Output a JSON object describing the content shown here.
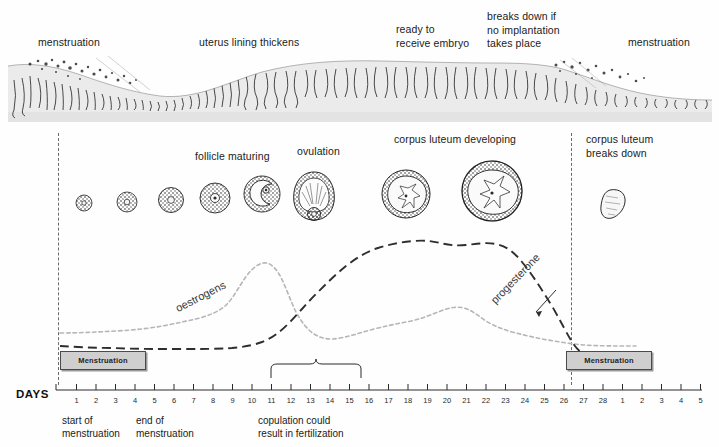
{
  "endometrium": {
    "labels": [
      {
        "text": "menstruation",
        "x": 38,
        "y": 36
      },
      {
        "text": "uterus lining thickens",
        "x": 199,
        "y": 36
      },
      {
        "text": "ready to\nreceive embryo",
        "x": 396,
        "y": 23
      },
      {
        "text": "breaks down if\nno implantation\ntakes place",
        "x": 487,
        "y": 10
      },
      {
        "text": "menstruation",
        "x": 628,
        "y": 36
      }
    ]
  },
  "follicles": {
    "labels": [
      {
        "text": "follicle maturing",
        "x": 195,
        "y": 150
      },
      {
        "text": "ovulation",
        "x": 297,
        "y": 145
      },
      {
        "text": "corpus luteum developing",
        "x": 394,
        "y": 133
      },
      {
        "text": "corpus luteum\nbreaks down",
        "x": 586,
        "y": 133
      }
    ],
    "stages": [
      {
        "name": "primordial-follicle",
        "cx": 84,
        "cy": 203,
        "r": 8,
        "kind": "solid"
      },
      {
        "name": "primary-follicle",
        "cx": 127,
        "cy": 202,
        "r": 10,
        "kind": "solid"
      },
      {
        "name": "secondary-follicle",
        "cx": 171,
        "cy": 200,
        "r": 12.5,
        "kind": "solid"
      },
      {
        "name": "tertiary-follicle",
        "cx": 215,
        "cy": 198,
        "r": 15,
        "kind": "ring"
      },
      {
        "name": "graafian-follicle",
        "cx": 262,
        "cy": 194,
        "r": 18,
        "kind": "antrum"
      },
      {
        "name": "ovulating-follicle",
        "cx": 314,
        "cy": 192,
        "r": 21,
        "kind": "ovulation"
      },
      {
        "name": "corpus-luteum-early",
        "cx": 406,
        "cy": 192,
        "r": 24,
        "kind": "luteum"
      },
      {
        "name": "corpus-luteum-mature",
        "cx": 492,
        "cy": 189,
        "r": 30,
        "kind": "luteum"
      },
      {
        "name": "corpus-albicans",
        "cx": 613,
        "cy": 193,
        "r": 15,
        "kind": "albicans"
      }
    ]
  },
  "graph": {
    "curve_labels": [
      {
        "name": "oestrogens",
        "text": "oestrogens",
        "x": 179,
        "y": 302,
        "rotate": -27
      },
      {
        "name": "progesterone",
        "text": "progesterone",
        "x": 497,
        "y": 294,
        "rotate": -46
      }
    ],
    "menstruation_boxes": [
      {
        "label": "Menstruation",
        "x": 60,
        "y": 351,
        "width": 84
      },
      {
        "label": "Menstruation",
        "x": 566,
        "y": 351,
        "width": 84
      }
    ],
    "fertile_brace": {
      "from_day": 11,
      "to_day": 15,
      "label": "copulation could\nresult in fertilization"
    }
  },
  "axis": {
    "caption": "DAYS",
    "day_labels": [
      "1",
      "2",
      "3",
      "4",
      "5",
      "6",
      "7",
      "8",
      "9",
      "10",
      "11",
      "12",
      "13",
      "14",
      "15",
      "16",
      "17",
      "18",
      "19",
      "20",
      "21",
      "22",
      "23",
      "24",
      "25",
      "26",
      "27",
      "28",
      "1",
      "2",
      "3",
      "4",
      "5"
    ],
    "x_start": 57,
    "x_step": 19.5
  },
  "footnotes": [
    {
      "text": "start of\nmenstruation",
      "x": 62,
      "y": 414
    },
    {
      "text": "end of\nmenstruation",
      "x": 136,
      "y": 414
    },
    {
      "text": "copulation could\nresult in fertilization",
      "x": 258,
      "y": 414
    }
  ],
  "chart_data": {
    "type": "line",
    "xlabel": "DAYS",
    "ylabel": "",
    "x": [
      1,
      2,
      3,
      4,
      5,
      6,
      7,
      8,
      9,
      10,
      11,
      12,
      13,
      14,
      15,
      16,
      17,
      18,
      19,
      20,
      21,
      22,
      23,
      24,
      25,
      26,
      27,
      28,
      29,
      30,
      31,
      32,
      33
    ],
    "xlim": [
      1,
      33
    ],
    "ylim": [
      0,
      100
    ],
    "grid": false,
    "legend": "inline-curve-labels",
    "series": [
      {
        "name": "oestrogens",
        "style": "dotted-light",
        "values": [
          20,
          20,
          20,
          20,
          21,
          22,
          24,
          27,
          31,
          33,
          36,
          52,
          74,
          62,
          40,
          26,
          24,
          28,
          31,
          32,
          33,
          36,
          42,
          45,
          40,
          36,
          33,
          28,
          22,
          18,
          16,
          15,
          15
        ]
      },
      {
        "name": "progesterone",
        "style": "dashed-dark",
        "values": [
          12,
          11,
          11,
          11,
          11,
          11,
          11,
          11,
          11,
          11,
          11,
          12,
          16,
          24,
          34,
          44,
          54,
          62,
          70,
          78,
          85,
          88,
          86,
          87,
          86,
          80,
          66,
          50,
          36,
          26,
          18,
          13,
          11
        ]
      }
    ]
  }
}
